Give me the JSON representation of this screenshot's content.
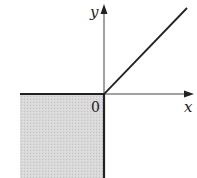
{
  "diagram": {
    "axes": {
      "x_label": "x",
      "y_label": "y",
      "origin_label": "0"
    },
    "colors": {
      "shade": "#d6d6d6",
      "line": "#222222",
      "axis": "#444444",
      "background": "#ffffff"
    },
    "elements": [
      {
        "type": "region",
        "name": "shaded-quadrant-III",
        "x_range": "x <= 0",
        "y_range": "y <= 0"
      },
      {
        "type": "boundary",
        "name": "negative-x-axis-bold",
        "from": [
          -1,
          0
        ],
        "to": [
          0,
          0
        ]
      },
      {
        "type": "boundary",
        "name": "negative-y-axis-bold",
        "from": [
          0,
          0
        ],
        "to": [
          0,
          -1
        ]
      },
      {
        "type": "ray",
        "name": "ray-y-equals-x",
        "from": [
          0,
          0
        ],
        "direction": [
          1,
          1
        ]
      }
    ]
  }
}
